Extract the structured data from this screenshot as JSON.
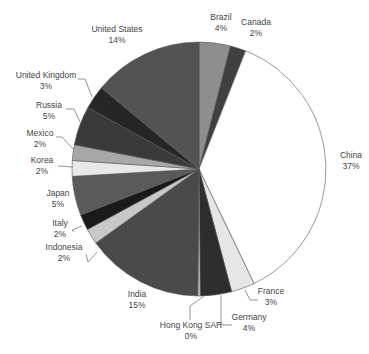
{
  "chart_data": {
    "type": "pie",
    "title": "",
    "start_angle_deg": 0,
    "direction": "clockwise",
    "legend": "none",
    "slices": [
      {
        "label": "China",
        "value": 37,
        "pct_label": "37%",
        "color": "#ffffff",
        "lx": 351,
        "ly": 158,
        "anchor": "middle",
        "line": null
      },
      {
        "label": "France",
        "value": 3,
        "pct_label": "3%",
        "color": "#e6e6e6",
        "lx": 271,
        "ly": 294,
        "anchor": "middle",
        "line": [
          [
            245,
            290
          ],
          [
            250,
            300
          ],
          [
            258,
            300
          ]
        ]
      },
      {
        "label": "Germany",
        "value": 4,
        "pct_label": "4%",
        "color": "#2e2e2e",
        "lx": 249,
        "ly": 320,
        "anchor": "middle",
        "line": [
          [
            221,
            295
          ],
          [
            221,
            325
          ],
          [
            232,
            325
          ]
        ]
      },
      {
        "label": "Hong Kong SAR",
        "value": 0.3,
        "pct_label": "0%",
        "color": "#cccccc",
        "lx": 191,
        "ly": 328,
        "anchor": "middle",
        "line": [
          [
            204,
            296
          ],
          [
            190,
            306
          ],
          [
            190,
            320
          ]
        ]
      },
      {
        "label": "India",
        "value": 15,
        "pct_label": "15%",
        "color": "#4a4a4a",
        "lx": 137,
        "ly": 297,
        "anchor": "middle",
        "line": null
      },
      {
        "label": "Indonesia",
        "value": 2,
        "pct_label": "2%",
        "color": "#c8c8c8",
        "lx": 64,
        "ly": 250,
        "anchor": "middle",
        "line": [
          [
            97,
            252
          ],
          [
            88,
            262
          ],
          [
            86,
            254
          ]
        ]
      },
      {
        "label": "Italy",
        "value": 2,
        "pct_label": "2%",
        "color": "#1a1a1a",
        "lx": 60,
        "ly": 226,
        "anchor": "middle",
        "line": [
          [
            82,
            226
          ],
          [
            72,
            230
          ],
          [
            74,
            232
          ]
        ]
      },
      {
        "label": "Japan",
        "value": 5,
        "pct_label": "5%",
        "color": "#5a5a5a",
        "lx": 58,
        "ly": 196,
        "anchor": "middle",
        "line": null
      },
      {
        "label": "Korea",
        "value": 2,
        "pct_label": "2%",
        "color": "#e8e8e8",
        "lx": 42,
        "ly": 163,
        "anchor": "middle",
        "line": [
          [
            58,
            166
          ],
          [
            73,
            167
          ]
        ]
      },
      {
        "label": "Mexico",
        "value": 2,
        "pct_label": "2%",
        "color": "#a8a8a8",
        "lx": 40,
        "ly": 136,
        "anchor": "middle",
        "line": [
          [
            56,
            137
          ],
          [
            62,
            137
          ],
          [
            73,
            149
          ]
        ]
      },
      {
        "label": "Russia",
        "value": 5,
        "pct_label": "5%",
        "color": "#3a3a3a",
        "lx": 49,
        "ly": 108,
        "anchor": "middle",
        "line": [
          [
            66,
            109
          ],
          [
            74,
            109
          ],
          [
            80,
            122
          ]
        ]
      },
      {
        "label": "United Kingdom",
        "value": 3,
        "pct_label": "3%",
        "color": "#262626",
        "lx": 46,
        "ly": 78,
        "anchor": "middle",
        "line": [
          [
            78,
            79
          ],
          [
            85,
            79
          ],
          [
            92,
            97
          ]
        ]
      },
      {
        "label": "United States",
        "value": 14,
        "pct_label": "14%",
        "color": "#535353",
        "lx": 117,
        "ly": 32,
        "anchor": "middle",
        "line": null
      },
      {
        "label": "Brazil",
        "value": 4,
        "pct_label": "4%",
        "color": "#8e8e8e",
        "lx": 221,
        "ly": 20,
        "anchor": "middle",
        "line": null
      },
      {
        "label": "Canada",
        "value": 2,
        "pct_label": "2%",
        "color": "#404040",
        "lx": 256,
        "ly": 25,
        "anchor": "middle",
        "line": null
      }
    ],
    "center": [
      199,
      169
    ],
    "radius": 127
  }
}
